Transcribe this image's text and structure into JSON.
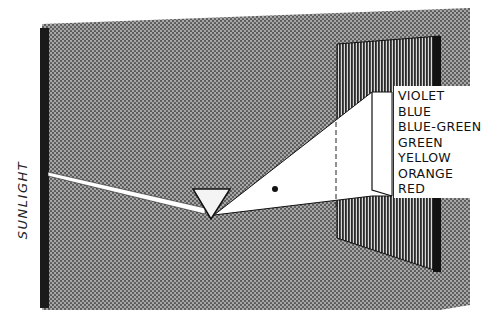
{
  "diagram": {
    "source_label": "SUNLIGHT",
    "spectrum": [
      "VIOLET",
      "BLUE",
      "BLUE-GREEN",
      "GREEN",
      "YELLOW",
      "ORANGE",
      "RED"
    ],
    "colors": {
      "background_halftone": "#8a8a8a",
      "screen": "#3a3a3a",
      "beam": "#ffffff",
      "wall_bar": "#1a1a1a"
    }
  }
}
